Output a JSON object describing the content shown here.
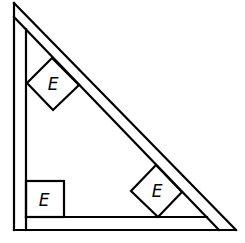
{
  "diagram": {
    "stroke_color": "#000000",
    "background_color": "#ffffff",
    "boxes": [
      {
        "id": "box-upper-hypotenuse",
        "label": "E",
        "orientation": "tilted 45°"
      },
      {
        "id": "box-lower-hypotenuse",
        "label": "E",
        "orientation": "tilted 45°"
      },
      {
        "id": "box-corner",
        "label": "E",
        "orientation": "upright"
      }
    ]
  }
}
